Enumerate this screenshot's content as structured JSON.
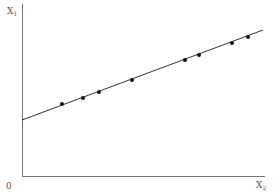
{
  "chart_data": {
    "type": "scatter",
    "title": "",
    "xlabel": "X2",
    "ylabel": "X1",
    "origin_label": "0",
    "x_label_main": "X",
    "x_label_sub": "2",
    "y_label_main": "X",
    "y_label_sub": "1",
    "xlim": [
      0,
      243
    ],
    "ylim": [
      0,
      172
    ],
    "grid": false,
    "legend": null,
    "points": [
      {
        "x": 40,
        "y": 72
      },
      {
        "x": 61,
        "y": 78
      },
      {
        "x": 77,
        "y": 84
      },
      {
        "x": 110,
        "y": 96
      },
      {
        "x": 163,
        "y": 116
      },
      {
        "x": 177,
        "y": 121
      },
      {
        "x": 210,
        "y": 133
      },
      {
        "x": 226,
        "y": 139
      }
    ],
    "fitted_line": {
      "x0": 0,
      "y0": 56,
      "x1": 241,
      "y1": 146
    },
    "note": "Axes have no numeric ticks; values are in relative plot units (pixel-scaled)."
  },
  "colors": {
    "axis": "#777777",
    "line": "#333333",
    "point": "#111111",
    "label": "#555555"
  },
  "plot": {
    "origin_px": [
      22,
      176
    ],
    "x_end_px": 265,
    "y_end_px": 4
  }
}
